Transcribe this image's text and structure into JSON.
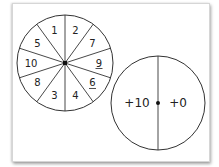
{
  "spinner_left": {
    "sectors_clockwise_from_top": [
      {
        "label": "2",
        "underline": false
      },
      {
        "label": "7",
        "underline": false
      },
      {
        "label": "9",
        "underline": true
      },
      {
        "label": "6",
        "underline": true
      },
      {
        "label": "4",
        "underline": false
      },
      {
        "label": "3",
        "underline": false
      },
      {
        "label": "8",
        "underline": false
      },
      {
        "label": "10",
        "underline": false
      },
      {
        "label": "5",
        "underline": false
      },
      {
        "label": "1",
        "underline": false
      }
    ]
  },
  "spinner_right": {
    "left_half": "+10",
    "right_half": "+0"
  },
  "colors": {
    "stroke": "#333333",
    "background": "#ffffff"
  }
}
